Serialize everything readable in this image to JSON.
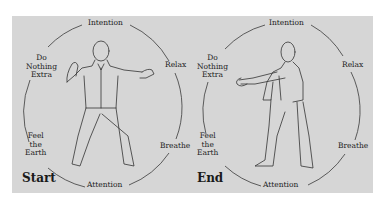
{
  "diagrams": [
    {
      "title": "Start",
      "labels": {
        "top": "Intention",
        "bottom": "Attention",
        "upper_left": [
          "Do",
          "Nothing",
          "Extra"
        ],
        "lower_left": [
          "Feel",
          "the",
          "Earth"
        ],
        "upper_right": "Relax",
        "lower_right": "Breathe"
      },
      "figure": "person-arms-open-stance"
    },
    {
      "title": "End",
      "labels": {
        "top": "Intention",
        "bottom": "Attention",
        "upper_left": [
          "Do",
          "Nothing",
          "Extra"
        ],
        "lower_left": [
          "Feel",
          "the",
          "Earth"
        ],
        "upper_right": "Relax",
        "lower_right": "Breathe"
      },
      "figure": "person-arms-forward-stance"
    }
  ],
  "colors": {
    "panel": "#d6d6d6",
    "line": "#333333",
    "text": "#222222"
  }
}
